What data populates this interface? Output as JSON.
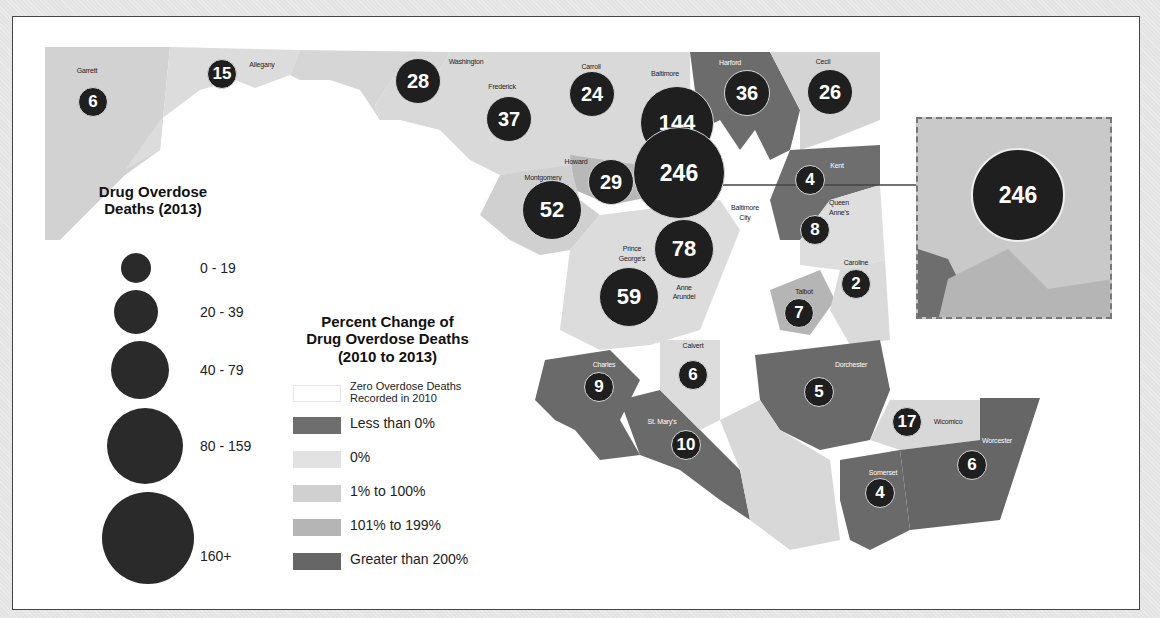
{
  "chart_data": {
    "type": "choropleth+proportional-symbol map",
    "region": "Maryland counties",
    "size_legend": {
      "title": "Drug Overdose Deaths (2013)",
      "classes": [
        "0 - 19",
        "20 - 39",
        "40 - 79",
        "80 - 159",
        "160+"
      ]
    },
    "color_legend": {
      "title": "Percent Change of Drug Overdose Deaths (2010 to 2013)",
      "classes": [
        {
          "label": "Zero Overdose Deaths Recorded in 2010",
          "color": "#ffffff"
        },
        {
          "label": "Less than 0%",
          "color": "#6e6e6e"
        },
        {
          "label": "0%",
          "color": "#e2e2e2"
        },
        {
          "label": "1% to 100%",
          "color": "#cfcfcf"
        },
        {
          "label": "101% to 199%",
          "color": "#b3b3b3"
        },
        {
          "label": "Greater than 200%",
          "color": "#666666"
        }
      ]
    },
    "counties": [
      {
        "name": "Garrett",
        "deaths_2013": 6
      },
      {
        "name": "Allegany",
        "deaths_2013": 15
      },
      {
        "name": "Washington",
        "deaths_2013": 28
      },
      {
        "name": "Frederick",
        "deaths_2013": 37
      },
      {
        "name": "Carroll",
        "deaths_2013": 24
      },
      {
        "name": "Baltimore",
        "deaths_2013": 144
      },
      {
        "name": "Harford",
        "deaths_2013": 36
      },
      {
        "name": "Cecil",
        "deaths_2013": 26
      },
      {
        "name": "Howard",
        "deaths_2013": 29
      },
      {
        "name": "Baltimore City",
        "deaths_2013": 246
      },
      {
        "name": "Montgomery",
        "deaths_2013": 52
      },
      {
        "name": "Kent",
        "deaths_2013": 4
      },
      {
        "name": "Queen Anne's",
        "deaths_2013": 8
      },
      {
        "name": "Prince George's",
        "deaths_2013": 59
      },
      {
        "name": "Anne Arundel",
        "deaths_2013": 78
      },
      {
        "name": "Caroline",
        "deaths_2013": 2
      },
      {
        "name": "Talbot",
        "deaths_2013": 7
      },
      {
        "name": "Calvert",
        "deaths_2013": 6
      },
      {
        "name": "Charles",
        "deaths_2013": 9
      },
      {
        "name": "St. Mary's",
        "deaths_2013": 10
      },
      {
        "name": "Dorchester",
        "deaths_2013": 5
      },
      {
        "name": "Wicomico",
        "deaths_2013": 17
      },
      {
        "name": "Worcester",
        "deaths_2013": 6
      },
      {
        "name": "Somerset",
        "deaths_2013": 4
      }
    ],
    "inset": {
      "value": 246,
      "label": "Baltimore City enlarged"
    }
  },
  "map": {
    "bubbles": [
      {
        "label": "6",
        "x": 93,
        "y": 102,
        "d": 30,
        "fs": 17
      },
      {
        "label": "15",
        "x": 222,
        "y": 74,
        "d": 30,
        "fs": 17
      },
      {
        "label": "28",
        "x": 418,
        "y": 81,
        "d": 46,
        "fs": 20
      },
      {
        "label": "37",
        "x": 509,
        "y": 119,
        "d": 46,
        "fs": 20
      },
      {
        "label": "24",
        "x": 592,
        "y": 94,
        "d": 46,
        "fs": 20
      },
      {
        "label": "144",
        "x": 677,
        "y": 123,
        "d": 74,
        "fs": 22
      },
      {
        "label": "246",
        "x": 679,
        "y": 173,
        "d": 92,
        "fs": 23
      },
      {
        "label": "36",
        "x": 747,
        "y": 93,
        "d": 46,
        "fs": 20
      },
      {
        "label": "26",
        "x": 830,
        "y": 92,
        "d": 46,
        "fs": 20
      },
      {
        "label": "29",
        "x": 611,
        "y": 182,
        "d": 46,
        "fs": 20
      },
      {
        "label": "52",
        "x": 552,
        "y": 210,
        "d": 60,
        "fs": 22
      },
      {
        "label": "4",
        "x": 810,
        "y": 180,
        "d": 30,
        "fs": 17
      },
      {
        "label": "8",
        "x": 815,
        "y": 230,
        "d": 30,
        "fs": 17
      },
      {
        "label": "78",
        "x": 684,
        "y": 249,
        "d": 60,
        "fs": 22
      },
      {
        "label": "59",
        "x": 629,
        "y": 297,
        "d": 60,
        "fs": 22
      },
      {
        "label": "2",
        "x": 856,
        "y": 284,
        "d": 30,
        "fs": 17
      },
      {
        "label": "7",
        "x": 799,
        "y": 313,
        "d": 30,
        "fs": 17
      },
      {
        "label": "6",
        "x": 693,
        "y": 375,
        "d": 30,
        "fs": 17
      },
      {
        "label": "9",
        "x": 599,
        "y": 387,
        "d": 30,
        "fs": 17
      },
      {
        "label": "10",
        "x": 686,
        "y": 445,
        "d": 30,
        "fs": 17
      },
      {
        "label": "5",
        "x": 819,
        "y": 392,
        "d": 30,
        "fs": 17
      },
      {
        "label": "17",
        "x": 907,
        "y": 422,
        "d": 30,
        "fs": 17
      },
      {
        "label": "6",
        "x": 972,
        "y": 465,
        "d": 30,
        "fs": 17
      },
      {
        "label": "4",
        "x": 880,
        "y": 493,
        "d": 30,
        "fs": 17
      }
    ],
    "labels": [
      {
        "text": "Garrett",
        "x": 87,
        "y": 70,
        "dark": false
      },
      {
        "text": "Allegany",
        "x": 262,
        "y": 64,
        "dark": false
      },
      {
        "text": "Washington",
        "x": 466,
        "y": 61,
        "dark": false
      },
      {
        "text": "Frederick",
        "x": 502,
        "y": 86,
        "dark": false
      },
      {
        "text": "Carroll",
        "x": 591,
        "y": 66,
        "dark": false
      },
      {
        "text": "Baltimore",
        "x": 665,
        "y": 73,
        "dark": false
      },
      {
        "text": "Harford",
        "x": 730,
        "y": 62,
        "dark": true
      },
      {
        "text": "Cecil",
        "x": 823,
        "y": 61,
        "dark": false
      },
      {
        "text": "Howard",
        "x": 576,
        "y": 161,
        "dark": false
      },
      {
        "text": "Montgomery",
        "x": 543,
        "y": 177,
        "dark": false
      },
      {
        "text": "Kent",
        "x": 837,
        "y": 165,
        "dark": true
      },
      {
        "text": "Baltimore",
        "x": 745,
        "y": 207,
        "dark": false
      },
      {
        "text": "City",
        "x": 745,
        "y": 217,
        "dark": false
      },
      {
        "text": "Queen",
        "x": 839,
        "y": 202,
        "dark": false
      },
      {
        "text": "Anne's",
        "x": 839,
        "y": 212,
        "dark": false
      },
      {
        "text": "Prince",
        "x": 632,
        "y": 248,
        "dark": false
      },
      {
        "text": "George's",
        "x": 632,
        "y": 258,
        "dark": false
      },
      {
        "text": "Anne",
        "x": 684,
        "y": 287,
        "dark": false
      },
      {
        "text": "Arundel",
        "x": 684,
        "y": 296,
        "dark": false
      },
      {
        "text": "Caroline",
        "x": 856,
        "y": 262,
        "dark": false
      },
      {
        "text": "Talbot",
        "x": 804,
        "y": 291,
        "dark": false
      },
      {
        "text": "Calvert",
        "x": 693,
        "y": 345,
        "dark": false
      },
      {
        "text": "Charles",
        "x": 604,
        "y": 364,
        "dark": true
      },
      {
        "text": "St. Mary's",
        "x": 662,
        "y": 421,
        "dark": true
      },
      {
        "text": "Dorchester",
        "x": 851,
        "y": 364,
        "dark": true
      },
      {
        "text": "Wicomico",
        "x": 948,
        "y": 421,
        "dark": false
      },
      {
        "text": "Worcester",
        "x": 997,
        "y": 440,
        "dark": true
      },
      {
        "text": "Somerset",
        "x": 883,
        "y": 472,
        "dark": true
      }
    ]
  },
  "legend_size": {
    "title_line1": "Drug Overdose",
    "title_line2": "Deaths (2013)",
    "items": [
      {
        "label": "0 - 19",
        "x": 136,
        "y": 268,
        "d": 30,
        "ly": 268
      },
      {
        "label": "20 - 39",
        "x": 136,
        "y": 312,
        "d": 44,
        "ly": 312
      },
      {
        "label": "40 - 79",
        "x": 140,
        "y": 370,
        "d": 58,
        "ly": 370
      },
      {
        "label": "80 - 159",
        "x": 145,
        "y": 446,
        "d": 76,
        "ly": 446
      },
      {
        "label": "160+",
        "x": 148,
        "y": 538,
        "d": 92,
        "ly": 556
      }
    ]
  },
  "legend_color": {
    "title_line1": "Percent Change of",
    "title_line2": "Drug Overdose Deaths",
    "title_line3": "(2010 to 2013)",
    "items": [
      {
        "label": "Zero Overdose Deaths",
        "label2": "Recorded in 2010",
        "color": "#ffffff",
        "y": 393
      },
      {
        "label": "Less than 0%",
        "label2": "",
        "color": "#6e6e6e",
        "y": 425
      },
      {
        "label": "0%",
        "label2": "",
        "color": "#e2e2e2",
        "y": 459
      },
      {
        "label": "1% to 100%",
        "label2": "",
        "color": "#d0d0d0",
        "y": 493
      },
      {
        "label": "101% to 199%",
        "label2": "",
        "color": "#b5b5b5",
        "y": 527
      },
      {
        "label": "Greater than 200%",
        "label2": "",
        "color": "#666666",
        "y": 561
      }
    ]
  },
  "inset": {
    "label": "246"
  }
}
